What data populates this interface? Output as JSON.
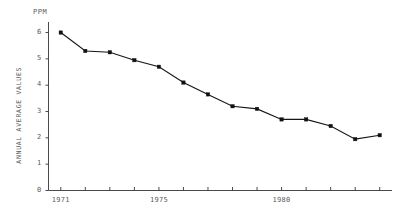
{
  "chart_data": {
    "type": "line",
    "title": "",
    "subtitle": "",
    "xlabel": "",
    "ylabel": "ANNUAL AVERAGE VALUES",
    "unit_label": "PPM",
    "x": [
      1971,
      1972,
      1973,
      1974,
      1975,
      1976,
      1977,
      1978,
      1979,
      1980,
      1981,
      1982,
      1983,
      1984
    ],
    "values": [
      6.0,
      5.3,
      5.25,
      4.95,
      4.7,
      4.1,
      3.65,
      3.2,
      3.1,
      2.7,
      2.7,
      2.45,
      1.95,
      2.1
    ],
    "series": [
      {
        "name": "Annual average values",
        "values": [
          6.0,
          5.3,
          5.25,
          4.95,
          4.7,
          4.1,
          3.65,
          3.2,
          3.1,
          2.7,
          2.7,
          2.45,
          1.95,
          2.1
        ]
      }
    ],
    "xlim": [
      1970.5,
      1984.5
    ],
    "ylim": [
      0,
      6.4
    ],
    "ytick_labels": [
      "6",
      "5",
      "4",
      "3",
      "2",
      "1",
      "0"
    ],
    "ytick_values": [
      6,
      5,
      4,
      3,
      2,
      1,
      0
    ],
    "xtick_labels": [
      "1971",
      "1975",
      "1980"
    ],
    "xtick_values": [
      1971,
      1975,
      1980
    ],
    "xticks_all": [
      1971,
      1972,
      1973,
      1974,
      1975,
      1976,
      1977,
      1978,
      1979,
      1980,
      1981,
      1982,
      1983,
      1984
    ],
    "grid": false,
    "legend": null,
    "marker": "square",
    "line_color": "#151515",
    "axis_color": "#4a4a4a",
    "text_color": "#5a5a5a",
    "background": "#ffffff"
  }
}
